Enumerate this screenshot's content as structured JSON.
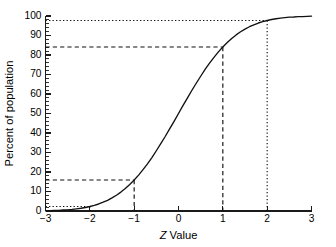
{
  "chart_data": {
    "type": "line",
    "title": "",
    "subtitle": "",
    "xlabel_prefix": "Z",
    "xlabel_suffix": "Value",
    "xlabel": "Z Value",
    "ylabel": "Percent of population",
    "xlim": [
      -3,
      3
    ],
    "ylim": [
      0,
      100
    ],
    "grid": false,
    "legend": "none",
    "x_ticks": [
      -3,
      -2,
      -1,
      0,
      1,
      2,
      3
    ],
    "x_tick_labels": [
      "−3",
      "−2",
      "−1",
      "0",
      "1",
      "2",
      "3"
    ],
    "y_ticks": [
      0,
      10,
      20,
      30,
      40,
      50,
      60,
      70,
      80,
      90,
      100
    ],
    "y_tick_labels": [
      "0",
      "10",
      "20",
      "30",
      "40",
      "50",
      "60",
      "70",
      "80",
      "90",
      "100"
    ],
    "y_minor_tick_step": 2,
    "series": [
      {
        "name": "Cumulative normal distribution",
        "description": "Standard normal cumulative distribution (ogive) of percent of population below a given Z value",
        "x": [
          -3.0,
          -2.9,
          -2.8,
          -2.7,
          -2.6,
          -2.5,
          -2.4,
          -2.3,
          -2.2,
          -2.1,
          -2.0,
          -1.9,
          -1.8,
          -1.7,
          -1.6,
          -1.5,
          -1.4,
          -1.3,
          -1.2,
          -1.1,
          -1.0,
          -0.9,
          -0.8,
          -0.7,
          -0.6,
          -0.5,
          -0.4,
          -0.3,
          -0.2,
          -0.1,
          0.0,
          0.1,
          0.2,
          0.3,
          0.4,
          0.5,
          0.6,
          0.7,
          0.8,
          0.9,
          1.0,
          1.1,
          1.2,
          1.3,
          1.4,
          1.5,
          1.6,
          1.7,
          1.8,
          1.9,
          2.0,
          2.1,
          2.2,
          2.3,
          2.4,
          2.5,
          2.6,
          2.7,
          2.8,
          2.9,
          3.0
        ],
        "y": [
          0.1,
          0.2,
          0.3,
          0.3,
          0.5,
          0.6,
          0.8,
          1.1,
          1.4,
          1.8,
          2.3,
          2.9,
          3.6,
          4.5,
          5.5,
          6.7,
          8.1,
          9.7,
          11.5,
          13.6,
          15.9,
          18.4,
          21.2,
          24.2,
          27.4,
          30.9,
          34.5,
          38.2,
          42.1,
          46.0,
          50.0,
          54.0,
          57.9,
          61.8,
          65.5,
          69.1,
          72.6,
          75.8,
          78.8,
          81.6,
          84.1,
          86.4,
          88.5,
          90.3,
          91.9,
          93.3,
          94.5,
          95.5,
          96.4,
          97.1,
          97.7,
          98.2,
          98.6,
          98.9,
          99.2,
          99.4,
          99.5,
          99.7,
          99.7,
          99.8,
          99.9
        ]
      }
    ],
    "reference_lines": [
      {
        "name": "z-minus-2",
        "z": -2,
        "percent": 2.3,
        "style": "dotted"
      },
      {
        "name": "z-minus-1",
        "z": -1,
        "percent": 15.9,
        "style": "dashed"
      },
      {
        "name": "z-plus-1",
        "z": 1,
        "percent": 84.1,
        "style": "dashed"
      },
      {
        "name": "z-plus-2",
        "z": 2,
        "percent": 97.7,
        "style": "dotted"
      }
    ],
    "colors": {
      "curve": "#111111",
      "axis": "#1a1a1a",
      "reference": "#111111",
      "background": "#ffffff"
    }
  }
}
